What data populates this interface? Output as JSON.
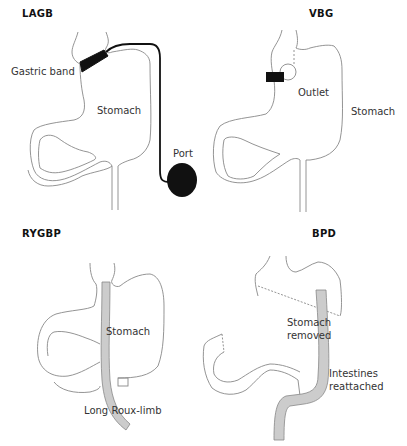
{
  "panels": {
    "lagb": {
      "title": "LAGB",
      "labels": {
        "band": "Gastric band",
        "stomach": "Stomach",
        "port": "Port"
      }
    },
    "vbg": {
      "title": "VBG",
      "labels": {
        "outlet": "Outlet",
        "stomach": "Stomach"
      }
    },
    "rygbp": {
      "title": "RYGBP",
      "labels": {
        "stomach": "Stomach",
        "limb": "Long Roux-limb"
      }
    },
    "bpd": {
      "title": "BPD",
      "labels": {
        "removed_1": "Stomach",
        "removed_2": "removed",
        "reattached_1": "Intestines",
        "reattached_2": "reattached"
      }
    }
  },
  "colors": {
    "outline": "#777777",
    "device": "#111111",
    "limb_fill": "#cccccc",
    "limb_stroke": "#888888"
  }
}
